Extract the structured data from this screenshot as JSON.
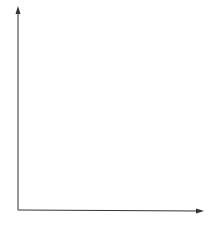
{
  "axes": {
    "y_label": "f",
    "x_label": "t"
  },
  "y_tick_labels": [
    {
      "base": "f",
      "sub": "N",
      "row": 7
    },
    {
      "base": "f",
      "sub": "3",
      "row": 2
    },
    {
      "base": "f",
      "sub": "2",
      "row": 1
    },
    {
      "base": "f",
      "sub": "1",
      "row": 0
    }
  ],
  "grid": {
    "columns": 9,
    "rows": 8,
    "shaded_cells": [
      {
        "col": 3,
        "row": 7
      },
      {
        "col": 2,
        "row": 6
      },
      {
        "col": 4,
        "row": 4
      },
      {
        "col": 8,
        "row": 4
      },
      {
        "col": 1,
        "row": 3
      },
      {
        "col": 7,
        "row": 3
      },
      {
        "col": 5,
        "row": 2
      },
      {
        "col": 0,
        "row": 1
      },
      {
        "col": 6,
        "row": 0
      }
    ],
    "shade_color": "#c8c8c8",
    "line_color": "#555555"
  }
}
